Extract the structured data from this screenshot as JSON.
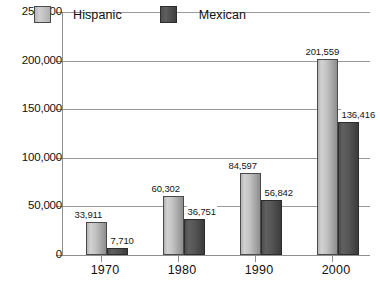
{
  "chart_data": {
    "type": "bar",
    "title": "",
    "subtitle": "",
    "xlabel": "",
    "ylabel": "",
    "categories": [
      "1970",
      "1980",
      "1990",
      "2000"
    ],
    "series": [
      {
        "name": "Hispanic",
        "color": "#c0c0c0",
        "values": [
          33911,
          60302,
          84597,
          201559
        ],
        "labels": [
          "33,911",
          "60,302",
          "84,597",
          "201,559"
        ]
      },
      {
        "name": "Mexican",
        "color": "#4d4d4d",
        "values": [
          7710,
          36751,
          56842,
          136416
        ],
        "labels": [
          "7,710",
          "36,751",
          "56,842",
          "136,416"
        ]
      }
    ],
    "ylim": [
      0,
      250000
    ],
    "ytick_values": [
      0,
      50000,
      100000,
      150000,
      200000,
      250000
    ],
    "ytick_labels": [
      "0",
      "50,000",
      "100,000",
      "150,000",
      "200,000",
      "250,000"
    ],
    "grid": true,
    "legend_position": "top-inside"
  },
  "legend": {
    "items": [
      {
        "label": "Hispanic",
        "swatch": "light-gray-swatch"
      },
      {
        "label": "Mexican",
        "swatch": "dark-gray-swatch"
      }
    ]
  }
}
